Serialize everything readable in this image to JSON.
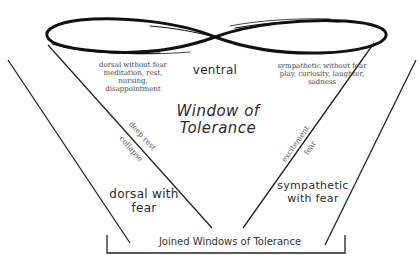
{
  "diagram": {
    "title": "Window of Tolerance",
    "title_line1": "Window of",
    "title_line2": "Tolerance",
    "center_top_label": "ventral",
    "top_left_block": {
      "line1": "dorsal without fear",
      "line2": "meditation, rest,",
      "line3": "nursing,",
      "line4": "disappointment"
    },
    "top_right_block": {
      "line1": "sympathetic without fear",
      "line2": "play, curiosity, laughter,",
      "line3": "sadness"
    },
    "left_diagonal": {
      "upper": "deep rest",
      "lower": "collapse"
    },
    "right_diagonal": {
      "upper": "excitement",
      "lower": "fear"
    },
    "left_zone": {
      "line1": "dorsal with",
      "line2": "fear"
    },
    "right_zone": {
      "line1": "sympathetic",
      "line2": "with fear"
    },
    "bracket_label": "Joined Windows of Tolerance",
    "colors": {
      "ink": "#1a1a1a",
      "background": "#ffffff"
    }
  }
}
